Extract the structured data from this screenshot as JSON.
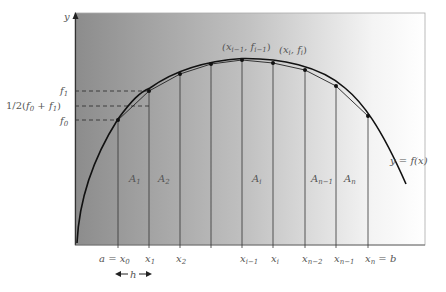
{
  "diagram": {
    "type": "trapezoidal-rule-illustration",
    "axis": {
      "y_label": "y"
    },
    "curve_label": "y = f(x)",
    "colors": {
      "background_left": "#8e8e8e",
      "background_right": "#ffffff",
      "curve": "#111111",
      "grid_line": "#333333",
      "text": "#555555"
    },
    "y_labels": {
      "f1": "f",
      "f1_sub": "1",
      "mid": "1/2(",
      "mid_f0": "f",
      "mid_f0_sub": "0",
      "mid_plus": " + ",
      "mid_f1": "f",
      "mid_f1_sub": "1",
      "mid_close": ")",
      "f0": "f",
      "f0_sub": "0"
    },
    "point_labels": {
      "prev": {
        "open": "(x",
        "x_sub": "i−1",
        "comma": ", f",
        "f_sub": "i−1",
        "close": ")"
      },
      "curr": {
        "open": "(x",
        "x_sub": "i",
        "comma": ", f",
        "f_sub": "i",
        "close": ")"
      }
    },
    "area_labels": [
      {
        "name": "A",
        "sub": "1"
      },
      {
        "name": "A",
        "sub": "2"
      },
      {
        "name": "A",
        "sub": "i"
      },
      {
        "name": "A",
        "sub": "n−1"
      },
      {
        "name": "A",
        "sub": "n"
      }
    ],
    "x_labels": [
      {
        "pre": "a = x",
        "sub": "0",
        "post": ""
      },
      {
        "pre": "x",
        "sub": "1",
        "post": ""
      },
      {
        "pre": "x",
        "sub": "2",
        "post": ""
      },
      {
        "pre": "x",
        "sub": "i−1",
        "post": ""
      },
      {
        "pre": "x",
        "sub": "i",
        "post": ""
      },
      {
        "pre": "x",
        "sub": "n−2",
        "post": ""
      },
      {
        "pre": "x",
        "sub": "n−1",
        "post": ""
      },
      {
        "pre": "x",
        "sub": "n",
        "post": " = b"
      }
    ],
    "step_label": "h",
    "nodes": [
      {
        "x": 118,
        "y": 120
      },
      {
        "x": 149,
        "y": 91
      },
      {
        "x": 180,
        "y": 74
      },
      {
        "x": 211,
        "y": 64
      },
      {
        "x": 242,
        "y": 60
      },
      {
        "x": 273,
        "y": 63
      },
      {
        "x": 305,
        "y": 70
      },
      {
        "x": 336,
        "y": 86
      },
      {
        "x": 368,
        "y": 116
      }
    ]
  }
}
